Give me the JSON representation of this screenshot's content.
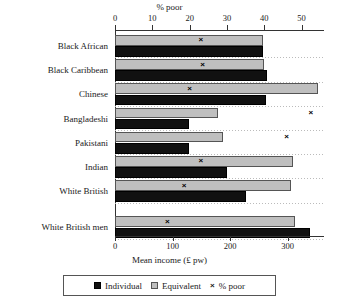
{
  "chart_data": {
    "type": "bar",
    "orientation": "horizontal",
    "title": "",
    "top_axis": {
      "label": "% poor",
      "ticks": [
        0,
        10,
        20,
        30,
        40,
        50
      ],
      "range": [
        0,
        56
      ]
    },
    "bottom_axis": {
      "label": "Mean income (£ pw)",
      "ticks": [
        0,
        100,
        200,
        300
      ],
      "range": [
        0,
        363
      ]
    },
    "categories": [
      "Black African",
      "Black Caribbean",
      "Chinese",
      "Bangladeshi",
      "Pakistani",
      "Indian",
      "White British",
      "White British men"
    ],
    "series": [
      {
        "name": "Individual",
        "axis": "bottom",
        "color": "#111111",
        "values": [
          257,
          264,
          262,
          128,
          128,
          195,
          228,
          339
        ]
      },
      {
        "name": "Equivalent",
        "axis": "bottom",
        "color": "#bfbfbf",
        "values": [
          257,
          258,
          353,
          179,
          188,
          310,
          305,
          313
        ]
      },
      {
        "name": "% poor",
        "axis": "top",
        "marker": "×",
        "color": "#000000",
        "values": [
          23.0,
          23.5,
          20.0,
          52.5,
          46.0,
          23.0,
          18.5,
          14.0
        ]
      }
    ],
    "legend": {
      "position": "bottom",
      "entries": [
        {
          "label": "Individual",
          "swatch": "black-square"
        },
        {
          "label": "Equivalent",
          "swatch": "gray-square"
        },
        {
          "label": "% poor",
          "swatch": "x-marker"
        }
      ]
    },
    "grid": true
  }
}
